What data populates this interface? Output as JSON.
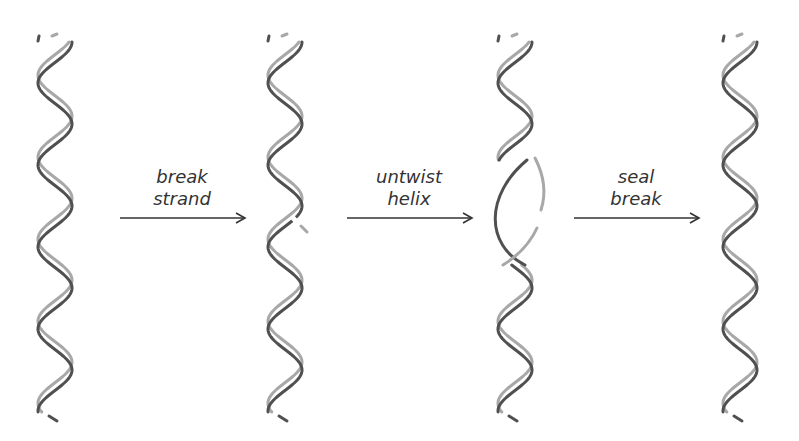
{
  "colors": {
    "dark_strand": "#505050",
    "light_strand": "#a8a8a8",
    "arrow": "#333333",
    "background": "#ffffff"
  },
  "helices": [
    {
      "id": "initial",
      "state": "intact double helix",
      "center_x": 55
    },
    {
      "id": "nicked",
      "state": "one strand broken",
      "center_x": 285
    },
    {
      "id": "untwisted",
      "state": "helix partially untwisted at break",
      "center_x": 515
    },
    {
      "id": "resealed",
      "state": "break sealed, fewer twists",
      "center_x": 740
    }
  ],
  "steps": [
    {
      "line1": "break",
      "line2": "strand"
    },
    {
      "line1": "untwist",
      "line2": "helix"
    },
    {
      "line1": "seal",
      "line2": "break"
    }
  ]
}
